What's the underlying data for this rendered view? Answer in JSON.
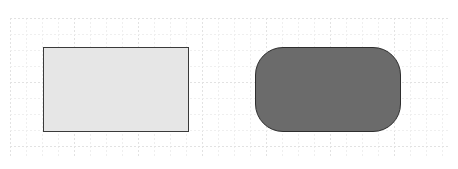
{
  "canvas": {
    "background": "#ffffff",
    "grid": {
      "minor_spacing": 16,
      "major_every": 4,
      "minor_color": "#efefef",
      "major_color": "#e2e2e2",
      "dashed": true
    }
  },
  "shapes": [
    {
      "id": "rectangle",
      "type": "rectangle",
      "x": 43,
      "y": 47,
      "width": 146,
      "height": 85,
      "fill": "#e6e6e6",
      "stroke": "#3a3a3a",
      "corner_radius": 0
    },
    {
      "id": "rounded-rectangle",
      "type": "rounded-rectangle",
      "x": 255,
      "y": 47,
      "width": 146,
      "height": 85,
      "fill": "#6b6b6b",
      "stroke": "#2e2e2e",
      "corner_radius": 28
    }
  ]
}
